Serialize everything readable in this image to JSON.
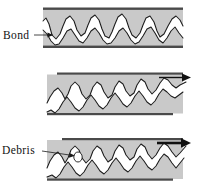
{
  "figure": {
    "background_color": "#ffffff",
    "body_color": "#c9c9c9",
    "edge_color": "#4a4a4a",
    "gap_color": "#ffffff",
    "line_color": "#1a1a1a",
    "arrow_color": "#111111"
  },
  "labels": {
    "bond": "Bond",
    "debris": "Debris"
  },
  "panels": [
    {
      "id": "panel-1",
      "stage": 1,
      "caption": "",
      "label": "Bond",
      "has_shear_arrow": false,
      "arrow_weight": "none",
      "has_debris": false
    },
    {
      "id": "panel-2",
      "stage": 2,
      "caption": "",
      "label": "",
      "has_shear_arrow": true,
      "arrow_weight": "thin",
      "has_debris": false
    },
    {
      "id": "panel-3",
      "stage": 3,
      "caption": "",
      "label": "Debris",
      "has_shear_arrow": true,
      "arrow_weight": "thick",
      "has_debris": true
    }
  ],
  "icons": {
    "shear_arrow": "arrow-right-icon",
    "leader_arrow": "leader-arrow-icon",
    "debris_particle": "debris-particle-icon"
  }
}
